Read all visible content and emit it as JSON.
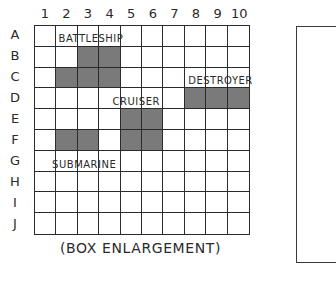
{
  "board": {
    "columns": [
      "1",
      "2",
      "3",
      "4",
      "5",
      "6",
      "7",
      "8",
      "9",
      "10"
    ],
    "rows": [
      "A",
      "B",
      "C",
      "D",
      "E",
      "F",
      "G",
      "H",
      "I",
      "J"
    ],
    "hit_color": "#7a7a7a",
    "ships": [
      {
        "name": "BATTLESHIP",
        "cells": [
          "B3",
          "B4",
          "C2",
          "C3",
          "C4"
        ],
        "label_row": "A",
        "label_col": 2
      },
      {
        "name": "DESTROYER",
        "cells": [
          "D8",
          "D9",
          "D10"
        ],
        "label_row": "C",
        "label_col": 8
      },
      {
        "name": "CRUISER",
        "cells": [
          "E5",
          "E6",
          "F5",
          "F6"
        ],
        "label_row": "D",
        "label_col": 4.5
      },
      {
        "name": "SUBMARINE",
        "cells": [
          "F2",
          "F3"
        ],
        "label_row": "G",
        "label_col": 1.7
      }
    ]
  },
  "caption": "(BOX ENLARGEMENT)"
}
